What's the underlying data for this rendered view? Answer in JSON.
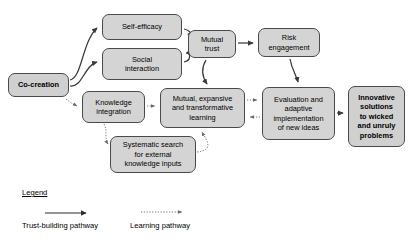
{
  "diagram": {
    "background_color": "#ffffff",
    "node_fill_color": "#d4d4d4",
    "node_border_color": "#4a4a4a",
    "arrow_color": "#3a3a3a",
    "nodes": [
      {
        "id": "co-creation",
        "label": "Co-creation",
        "bold": true,
        "x": 8,
        "y": 73,
        "w": 61,
        "h": 24
      },
      {
        "id": "self-efficacy",
        "label": "Self-efficacy",
        "bold": false,
        "x": 102,
        "y": 14,
        "w": 80,
        "h": 26
      },
      {
        "id": "social-interaction",
        "label": "Social\ninteraction",
        "bold": false,
        "x": 102,
        "y": 48,
        "w": 80,
        "h": 32
      },
      {
        "id": "mutual-trust",
        "label": "Mutual\ntrust",
        "bold": false,
        "x": 188,
        "y": 30,
        "w": 48,
        "h": 28
      },
      {
        "id": "risk-engagement",
        "label": "Risk\nengagement",
        "bold": false,
        "x": 258,
        "y": 28,
        "w": 62,
        "h": 29
      },
      {
        "id": "knowledge-integration",
        "label": "Knowledge\nintegration",
        "bold": false,
        "x": 82,
        "y": 91,
        "w": 63,
        "h": 32
      },
      {
        "id": "mutual-expansive-learning",
        "label": "Mutual, expansive\nand transformative\nlearning",
        "bold": false,
        "x": 160,
        "y": 88,
        "w": 85,
        "h": 40
      },
      {
        "id": "systematic-search",
        "label": "Systematic search\nfor external\nknowledge inputs",
        "bold": false,
        "x": 110,
        "y": 136,
        "w": 86,
        "h": 37
      },
      {
        "id": "evaluation-adaptive-implementation",
        "label": "Evaluation and\nadaptive\nimplementation\nof new ideas",
        "bold": false,
        "x": 262,
        "y": 87,
        "w": 73,
        "h": 53
      },
      {
        "id": "innovative-solutions",
        "label": "Innovative\nsolutions\nto wicked\nand unruly\nproblems",
        "bold": true,
        "x": 348,
        "y": 86,
        "w": 57,
        "h": 61
      }
    ],
    "edges": [
      {
        "id": "co-creation-to-self-efficacy",
        "type": "trust"
      },
      {
        "id": "co-creation-to-social-interaction",
        "type": "trust"
      },
      {
        "id": "self-efficacy-to-mutual-trust",
        "type": "trust"
      },
      {
        "id": "social-interaction-to-mutual-trust",
        "type": "trust"
      },
      {
        "id": "mutual-trust-to-risk-engagement",
        "type": "trust"
      },
      {
        "id": "mutual-trust-to-learning",
        "type": "trust"
      },
      {
        "id": "risk-engagement-to-evaluation",
        "type": "trust"
      },
      {
        "id": "evaluation-to-innovative-solutions",
        "type": "trust"
      },
      {
        "id": "co-creation-to-knowledge-integration",
        "type": "learning"
      },
      {
        "id": "knowledge-integration-to-learning",
        "type": "learning"
      },
      {
        "id": "knowledge-integration-to-systematic-search",
        "type": "learning"
      },
      {
        "id": "systematic-search-to-learning",
        "type": "learning"
      },
      {
        "id": "learning-to-evaluation",
        "type": "learning"
      },
      {
        "id": "evaluation-to-learning",
        "type": "learning"
      }
    ]
  },
  "legend": {
    "title": "Legend",
    "items": [
      {
        "id": "trust-building",
        "label": "Trust-building pathway",
        "style": "solid"
      },
      {
        "id": "learning",
        "label": "Learning pathway",
        "style": "dotted"
      }
    ]
  }
}
